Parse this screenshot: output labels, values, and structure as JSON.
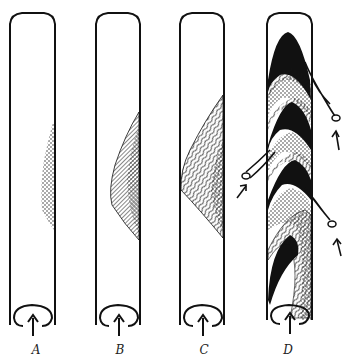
{
  "figure": {
    "panels": [
      {
        "id": "A",
        "label": "A",
        "description": "Tube with small stippled deposit on right wall"
      },
      {
        "id": "B",
        "label": "B",
        "description": "Tube with hatched and stippled wedge deposit on right wall"
      },
      {
        "id": "C",
        "label": "C",
        "description": "Tube with larger layered wavy-line deposit on right wall"
      },
      {
        "id": "D",
        "label": "D",
        "description": "Tube filled with alternating black, stippled and layered bands with side branches and arrows"
      }
    ],
    "colors": {
      "ink": "#111111",
      "background": "#ffffff"
    }
  }
}
